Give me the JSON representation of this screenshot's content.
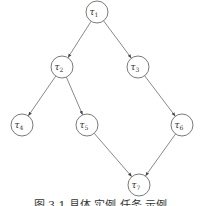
{
  "diagram": {
    "type": "directed-acyclic-graph",
    "nodes": [
      {
        "id": "t1",
        "label": "τ",
        "sub": "1",
        "x": 97,
        "y": 12
      },
      {
        "id": "t2",
        "label": "τ",
        "sub": "2",
        "x": 62,
        "y": 67
      },
      {
        "id": "t3",
        "label": "τ",
        "sub": "3",
        "x": 138,
        "y": 67
      },
      {
        "id": "t4",
        "label": "τ",
        "sub": "4",
        "x": 22,
        "y": 125
      },
      {
        "id": "t5",
        "label": "τ",
        "sub": "5",
        "x": 87,
        "y": 125
      },
      {
        "id": "t6",
        "label": "τ",
        "sub": "6",
        "x": 182,
        "y": 125
      },
      {
        "id": "t7",
        "label": "τ",
        "sub": "7",
        "x": 139,
        "y": 185
      }
    ],
    "edges": [
      {
        "from": "t1",
        "to": "t2"
      },
      {
        "from": "t1",
        "to": "t3"
      },
      {
        "from": "t2",
        "to": "t4"
      },
      {
        "from": "t2",
        "to": "t5"
      },
      {
        "from": "t3",
        "to": "t6"
      },
      {
        "from": "t5",
        "to": "t7"
      },
      {
        "from": "t6",
        "to": "t7"
      }
    ],
    "node_radius": 11,
    "caption": "图 3.1  具体 实例 任务 示例"
  }
}
